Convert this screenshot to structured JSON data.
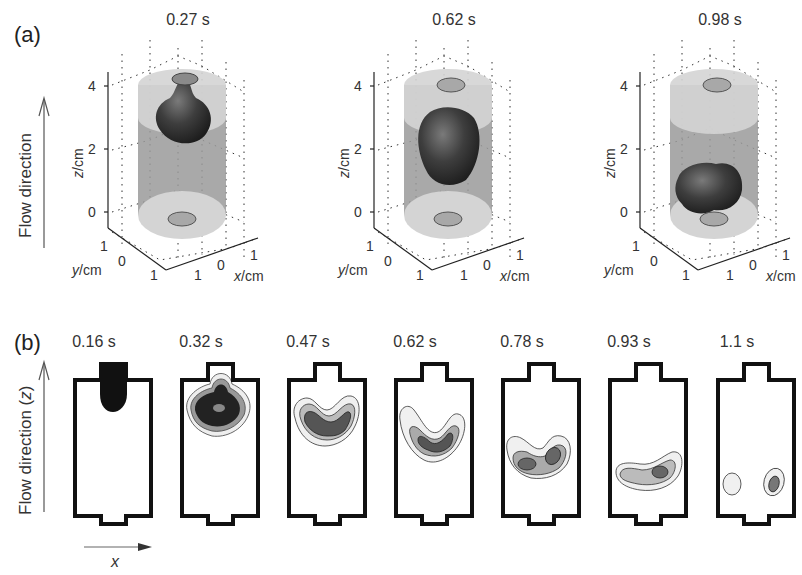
{
  "figure": {
    "panel_a": {
      "label": "(a)",
      "flow_label": "Flow direction",
      "plots": [
        {
          "time": "0.27 s",
          "z_ticks": [
            "4",
            "2",
            "0"
          ],
          "y_ticks": [
            "1",
            "0",
            "1"
          ],
          "x_ticks": [
            "1",
            "0",
            "1"
          ],
          "z_label": "z",
          "y_label": "y",
          "x_label": "x",
          "unit": "/cm"
        },
        {
          "time": "0.62 s",
          "z_ticks": [
            "4",
            "2",
            "0"
          ],
          "y_ticks": [
            "1",
            "0",
            "1"
          ],
          "x_ticks": [
            "1",
            "0",
            "1"
          ],
          "z_label": "z",
          "y_label": "y",
          "x_label": "x",
          "unit": "/cm"
        },
        {
          "time": "0.98 s",
          "z_ticks": [
            "4",
            "2",
            "0"
          ],
          "y_ticks": [
            "1",
            "0",
            "1"
          ],
          "x_ticks": [
            "1",
            "0",
            "1"
          ],
          "z_label": "z",
          "y_label": "y",
          "x_label": "x",
          "unit": "/cm"
        }
      ]
    },
    "panel_b": {
      "label": "(b)",
      "flow_label_text": "Flow direction (",
      "flow_label_var": "z",
      "flow_label_close": ")",
      "x_axis_label": "x",
      "frames": [
        {
          "time": "0.16 s"
        },
        {
          "time": "0.32 s"
        },
        {
          "time": "0.47 s"
        },
        {
          "time": "0.62 s"
        },
        {
          "time": "0.78 s"
        },
        {
          "time": "0.93 s"
        },
        {
          "time": "1.1 s"
        }
      ]
    },
    "colors": {
      "cylinder_body": "#9a9a9a",
      "cylinder_cap": "#d4d4d4",
      "blob_dark": "#3a3a3a",
      "outline": "#111111"
    }
  }
}
